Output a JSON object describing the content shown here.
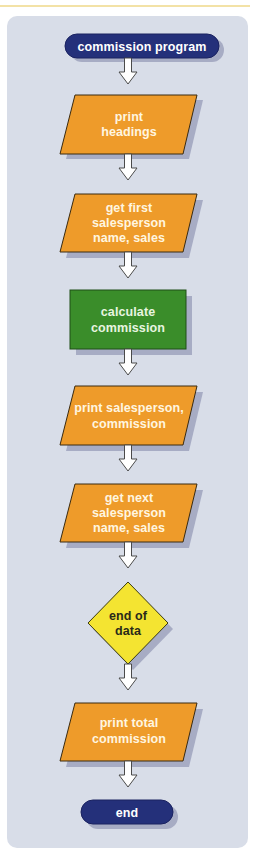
{
  "colors": {
    "panel": "#d8dde8",
    "terminal": "#24307a",
    "io": "#ee9b2a",
    "process": "#3a8d2a",
    "decision": "#f4e431",
    "shadow": "#a7acc4",
    "arrow_fill": "#ffffff",
    "arrow_stroke": "#4a4a4a"
  },
  "flowchart": {
    "start": {
      "shape": "terminal",
      "label": "commission program"
    },
    "steps": [
      {
        "shape": "io",
        "lines": [
          "print",
          "headings"
        ]
      },
      {
        "shape": "io",
        "lines": [
          "get first",
          "salesperson",
          "name, sales"
        ]
      },
      {
        "shape": "process",
        "lines": [
          "calculate",
          "commission"
        ]
      },
      {
        "shape": "io",
        "lines": [
          "print salesperson,",
          "commission"
        ]
      },
      {
        "shape": "io",
        "lines": [
          "get next",
          "salesperson",
          "name, sales"
        ]
      },
      {
        "shape": "decision",
        "lines": [
          "end of",
          "data"
        ]
      },
      {
        "shape": "io",
        "lines": [
          "print total",
          "commission"
        ]
      }
    ],
    "end": {
      "shape": "terminal",
      "label": "end"
    }
  }
}
